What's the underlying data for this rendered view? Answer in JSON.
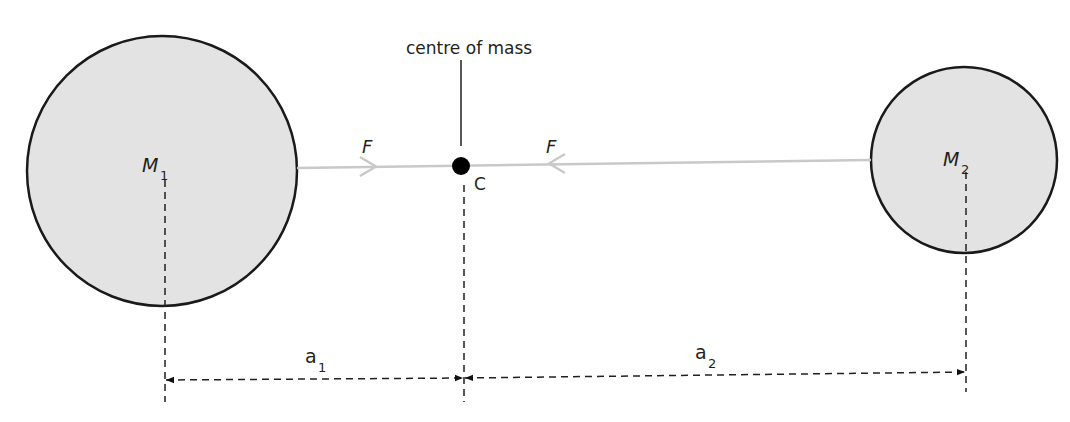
{
  "diagram": {
    "labels": {
      "centre_of_mass": "centre of mass",
      "centre_point": "C",
      "mass1": "M",
      "mass1_sub": "1",
      "mass2": "M",
      "mass2_sub": "2",
      "force_left": "F",
      "force_right": "F",
      "distance1": "a",
      "distance1_sub": "1",
      "distance2": "a",
      "distance2_sub": "2"
    },
    "colors": {
      "body_fill": "#e3e3e3",
      "body_stroke": "#1a1a1a",
      "force_line": "#c9c9c9",
      "text": "#231f20",
      "dot": "#000000"
    }
  }
}
